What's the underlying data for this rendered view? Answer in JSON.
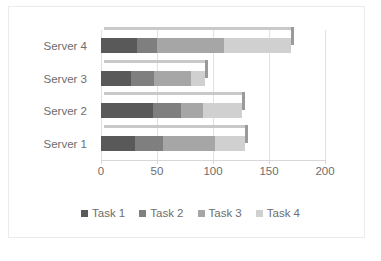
{
  "chart_data": {
    "type": "bar",
    "orientation": "horizontal",
    "stacked": true,
    "title": "",
    "xlabel": "",
    "ylabel": "",
    "categories": [
      "Server 4",
      "Server 3",
      "Server 2",
      "Server 1"
    ],
    "series": [
      {
        "name": "Task 1",
        "color": "#595959",
        "values": [
          32,
          27,
          46,
          30
        ]
      },
      {
        "name": "Task 2",
        "color": "#7f7f7f",
        "values": [
          18,
          20,
          25,
          25
        ]
      },
      {
        "name": "Task 3",
        "color": "#a6a6a6",
        "values": [
          60,
          33,
          20,
          47
        ]
      },
      {
        "name": "Task 4",
        "color": "#d0d0d0",
        "values": [
          60,
          13,
          35,
          27
        ]
      }
    ],
    "totals": [
      170,
      93,
      126,
      129
    ],
    "xlim": [
      0,
      200
    ],
    "xticks": [
      0,
      50,
      100,
      150,
      200
    ],
    "xtick_labels": [
      "0",
      "50",
      "100",
      "150",
      "200"
    ],
    "grid": true,
    "grid_axis": "x",
    "legend_position": "bottom",
    "legend_entries": [
      "Task 1",
      "Task 2",
      "Task 3",
      "Task 4"
    ],
    "style": {
      "background": "#ffffff",
      "gridline_color": "#e2e0e0",
      "axis_color": "#d9d7d7",
      "text_color": "#6d6d6d",
      "bevel_top": "#c9c9c9",
      "bevel_side": "#9a9a9a"
    }
  }
}
